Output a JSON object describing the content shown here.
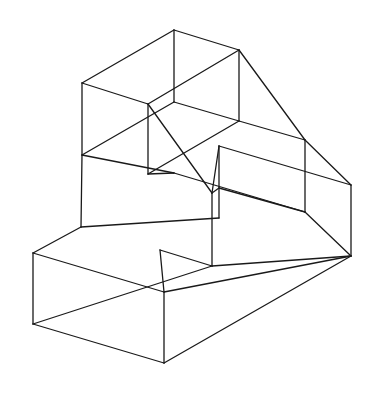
{
  "diagram": {
    "type": "wireframe-isometric-solid",
    "stroke_color": "#1a1a1a",
    "background": "#ffffff",
    "vertices": {
      "A": [
        174,
        30
      ],
      "B": [
        82,
        83
      ],
      "C": [
        239,
        50
      ],
      "D": [
        148,
        104
      ],
      "E": [
        305,
        140
      ],
      "F": [
        82,
        155
      ],
      "G": [
        174,
        102
      ],
      "H": [
        239,
        121
      ],
      "I": [
        148,
        174
      ],
      "J": [
        174,
        173
      ],
      "K": [
        219,
        146
      ],
      "L": [
        212,
        193
      ],
      "M": [
        219,
        188
      ],
      "N": [
        351,
        185
      ],
      "O": [
        305,
        212
      ],
      "P": [
        219,
        218
      ],
      "Q": [
        212,
        266
      ],
      "R": [
        351,
        256
      ],
      "S": [
        33,
        253
      ],
      "T": [
        33,
        324
      ],
      "U": [
        164,
        292
      ],
      "V": [
        164,
        363
      ],
      "W": [
        81,
        227
      ],
      "X": [
        160,
        250
      ],
      "Y": [
        270,
        232
      ]
    },
    "edges": [
      [
        "A",
        "B"
      ],
      [
        "A",
        "C"
      ],
      [
        "B",
        "D"
      ],
      [
        "C",
        "D"
      ],
      [
        "A",
        "G"
      ],
      [
        "B",
        "F"
      ],
      [
        "C",
        "H"
      ],
      [
        "C",
        "E"
      ],
      [
        "D",
        "I"
      ],
      [
        "D",
        "L"
      ],
      [
        "F",
        "G"
      ],
      [
        "G",
        "H"
      ],
      [
        "H",
        "E"
      ],
      [
        "F",
        "J"
      ],
      [
        "I",
        "J"
      ],
      [
        "I",
        "H"
      ],
      [
        "J",
        "O"
      ],
      [
        "E",
        "O"
      ],
      [
        "E",
        "N"
      ],
      [
        "K",
        "N"
      ],
      [
        "K",
        "P"
      ],
      [
        "K",
        "L"
      ],
      [
        "L",
        "Q"
      ],
      [
        "F",
        "W"
      ],
      [
        "W",
        "P"
      ],
      [
        "W",
        "S"
      ],
      [
        "S",
        "U"
      ],
      [
        "S",
        "T"
      ],
      [
        "U",
        "V"
      ],
      [
        "T",
        "V"
      ],
      [
        "U",
        "R"
      ],
      [
        "V",
        "R"
      ],
      [
        "N",
        "R"
      ],
      [
        "O",
        "R"
      ],
      [
        "Q",
        "R"
      ],
      [
        "T",
        "Q"
      ],
      [
        "M",
        "O"
      ],
      [
        "L",
        "M"
      ],
      [
        "X",
        "U"
      ],
      [
        "X",
        "Q"
      ]
    ]
  }
}
